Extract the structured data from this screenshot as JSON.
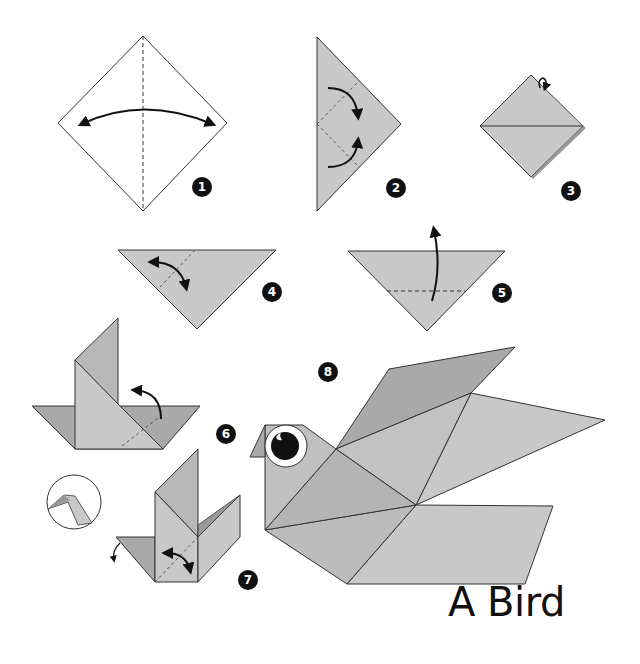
{
  "title": "A Bird",
  "colors": {
    "paper": "#c8c8c8",
    "paper_dark": "#a9a9a9",
    "paper_mid": "#b8b8b8",
    "paper_white": "#ffffff",
    "line": "#333333",
    "badge": "#111111",
    "eye_pupil": "#111111"
  },
  "steps": [
    {
      "number": "1",
      "description": "White square diamond, vertical dashed center crease, two-headed curved arrow (fold and unfold)"
    },
    {
      "number": "2",
      "description": "Triangle pointing right, two dashed folds with curved arrows folding top and bottom edges to center"
    },
    {
      "number": "3",
      "description": "Diamond with horizontal center line, small rotation arrow at top (turn over)"
    },
    {
      "number": "4",
      "description": "Inverted triangle with dashed diagonal crease and curved fold arrow on left corner"
    },
    {
      "number": "5",
      "description": "Inverted triangle with horizontal dashed line and arrow folding bottom point upward"
    },
    {
      "number": "6",
      "description": "Folded shape with tall flap, dashed crease and curved arrow on right side"
    },
    {
      "number": "7",
      "description": "Shape with two upright flaps, curved arrow fold, small arrow on left wing, detail inset circle"
    },
    {
      "number": "8",
      "description": "Finished origami bird with eye, head, body and wings"
    }
  ]
}
